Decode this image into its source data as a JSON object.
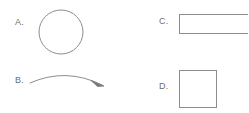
{
  "diagram": {
    "background_color": "#ffffff",
    "stroke_color": "#8c8c8c",
    "label_color": "#6e6e6e",
    "width": 248,
    "height": 113,
    "options": [
      {
        "key": "A",
        "label": "A.",
        "shape": "circle",
        "shape_name": "circle-outline",
        "geometry": {
          "cx": 23,
          "cy": 23,
          "r": 22
        },
        "stroke_color": "#8c8c8c",
        "stroke_width": 1,
        "fill": "none"
      },
      {
        "key": "B",
        "label": "B.",
        "shape": "curved-arrow",
        "shape_name": "curved-arrow-right",
        "geometry": {
          "path": "M 2 10 Q 38 -6 74 12",
          "arrowhead": "M 74 12 L 64 8 L 70 14 Z"
        },
        "stroke_color": "#8c8c8c",
        "stroke_width": 1,
        "fill": "none"
      },
      {
        "key": "C",
        "label": "C.",
        "shape": "rectangle",
        "shape_name": "wide-rectangle-outline",
        "geometry": {
          "x": 2,
          "y": 2,
          "width": 74,
          "height": 19
        },
        "clipped_at_right_edge": true,
        "stroke_color": "#8c8c8c",
        "stroke_width": 1,
        "fill": "none"
      },
      {
        "key": "D",
        "label": "D.",
        "shape": "square",
        "shape_name": "square-outline",
        "geometry": {
          "x": 2,
          "y": 2,
          "width": 37,
          "height": 37
        },
        "stroke_color": "#8c8c8c",
        "stroke_width": 1,
        "fill": "none"
      }
    ]
  }
}
